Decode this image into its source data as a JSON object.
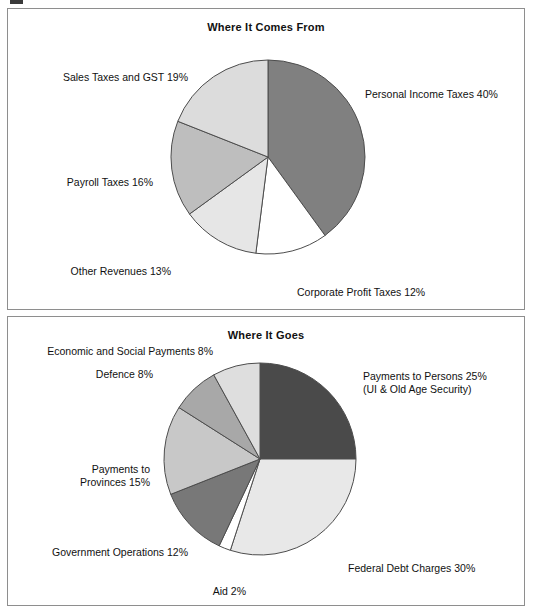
{
  "figure": {
    "panels": [
      {
        "id": "where-it-comes-from",
        "title": "Where It Comes From"
      },
      {
        "id": "where-it-goes",
        "title": "Where It Goes"
      }
    ]
  },
  "labels": {
    "top": {
      "personal_income_taxes": "Personal Income Taxes 40%",
      "corporate_profit_taxes": "Corporate Profit Taxes 12%",
      "other_revenues": "Other Revenues 13%",
      "payroll_taxes": "Payroll Taxes 16%",
      "sales_taxes_gst": "Sales Taxes and GST 19%"
    },
    "bottom": {
      "payments_to_persons_line1": "Payments to Persons 25%",
      "payments_to_persons_line2": "(UI & Old Age Security)",
      "federal_debt_charges": "Federal Debt Charges 30%",
      "aid": "Aid 2%",
      "government_operations": "Government Operations 12%",
      "payments_to_provinces_line1": "Payments to",
      "payments_to_provinces_line2": "Provinces 15%",
      "defence": "Defence 8%",
      "economic_and_social_payments": "Economic and Social Payments 8%"
    }
  },
  "chart_data": [
    {
      "type": "pie",
      "title": "Where It Comes From",
      "start_angle_deg": 0,
      "direction": "clockwise",
      "legend": "external-labels",
      "categories": [
        "Personal Income Taxes",
        "Corporate Profit Taxes",
        "Other Revenues",
        "Payroll Taxes",
        "Sales Taxes and GST"
      ],
      "values": [
        40,
        12,
        13,
        16,
        19
      ],
      "units": "percent",
      "labels": [
        "Personal Income Taxes 40%",
        "Corporate Profit Taxes 12%",
        "Other Revenues 13%",
        "Payroll Taxes 16%",
        "Sales Taxes and GST 19%"
      ],
      "colors": [
        "#808080",
        "#ffffff",
        "#e6e6e6",
        "#bebebe",
        "#dcdcdc"
      ],
      "stroke": "#4d4d4d"
    },
    {
      "type": "pie",
      "title": "Where It Goes",
      "start_angle_deg": 0,
      "direction": "clockwise",
      "legend": "external-labels",
      "categories": [
        "Payments to Persons (UI & Old Age Security)",
        "Federal Debt Charges",
        "Aid",
        "Government Operations",
        "Payments to Provinces",
        "Defence",
        "Economic and Social Payments"
      ],
      "values": [
        25,
        30,
        2,
        12,
        15,
        8,
        8
      ],
      "units": "percent",
      "labels": [
        "Payments to Persons 25% (UI & Old Age Security)",
        "Federal Debt Charges 30%",
        "Aid 2%",
        "Government Operations 12%",
        "Payments to Provinces 15%",
        "Defence 8%",
        "Economic and Social Payments 8%"
      ],
      "colors": [
        "#4a4a4a",
        "#e8e8e8",
        "#ffffff",
        "#787878",
        "#c8c8c8",
        "#a8a8a8",
        "#dedede"
      ],
      "stroke": "#4d4d4d"
    }
  ],
  "colors": {
    "panel_border": "#8e8e8e",
    "text": "#111111",
    "background": "#ffffff"
  }
}
